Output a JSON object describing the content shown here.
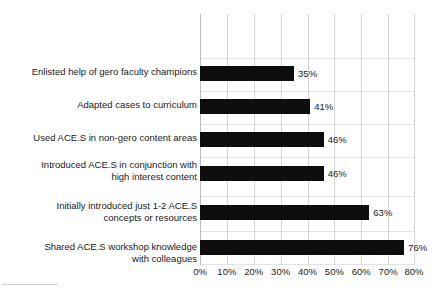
{
  "chart_data": {
    "type": "bar",
    "orientation": "horizontal",
    "title": "",
    "subtitle": "",
    "xlabel": "",
    "ylabel": "",
    "xlim": [
      0,
      80
    ],
    "xticks": [
      0,
      10,
      20,
      30,
      40,
      50,
      60,
      70,
      80
    ],
    "xtick_labels": [
      "0%",
      "10%",
      "20%",
      "30%",
      "40%",
      "50%",
      "60%",
      "70%",
      "80%"
    ],
    "grid": true,
    "legend": false,
    "bar_color": "#0d0d0d",
    "gridline_color": "#d5d5d5",
    "categories": [
      "Enlisted help of gero faculty champions",
      "Adapted cases to curriculum",
      "Used ACE.S in non-gero content areas",
      "Introduced ACE.S in conjunction with\nhigh interest content",
      "Initially introduced just 1-2 ACE.S\nconcepts or resources",
      "Shared ACE.S workshop knowledge\nwith colleagues"
    ],
    "values": [
      35,
      41,
      46,
      46,
      63,
      76
    ],
    "value_labels": [
      "35%",
      "41%",
      "46%",
      "46%",
      "63%",
      "76%"
    ]
  },
  "bars": [
    {
      "label": "Enlisted help of gero faculty champions",
      "value": 35,
      "value_label": "35%"
    },
    {
      "label": "Adapted cases to curriculum",
      "value": 41,
      "value_label": "41%"
    },
    {
      "label": "Used ACE.S in non-gero content areas",
      "value": 46,
      "value_label": "46%"
    },
    {
      "label": "Introduced ACE.S in conjunction with\nhigh interest content",
      "value": 46,
      "value_label": "46%"
    },
    {
      "label": "Initially introduced just 1-2 ACE.S\nconcepts or resources",
      "value": 63,
      "value_label": "63%"
    },
    {
      "label": "Shared ACE.S workshop knowledge\nwith colleagues",
      "value": 76,
      "value_label": "76%"
    }
  ]
}
